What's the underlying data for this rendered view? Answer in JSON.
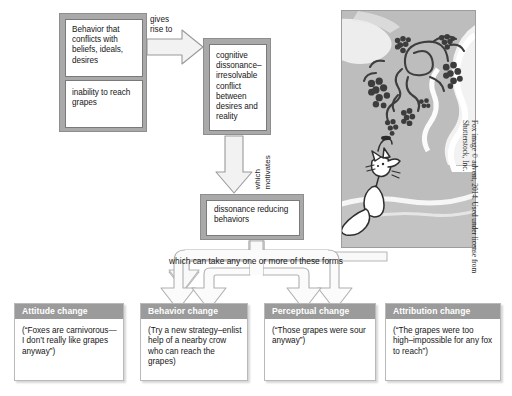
{
  "diagram": {
    "antecedent": {
      "general_label": "Behavior that conflicts with beliefs, ideals, desires",
      "example_label": "inability to reach grapes"
    },
    "connector_1_label_line1": "gives",
    "connector_1_label_line2": "rise to",
    "dissonance": {
      "label": "cognitive dissonance–irresolvable conflict between desires and reality"
    },
    "connector_2_label_line1": "which",
    "connector_2_label_line2": "motivates",
    "reducing": {
      "label": "dissonance reducing behaviors"
    },
    "banner_label": "which can take any one or more of these forms",
    "outcomes": [
      {
        "heading": "Attitude change",
        "example": "(“Foxes are carnivorous—I don’t really like grapes anyway”)"
      },
      {
        "heading": "Behavior change",
        "example": "(Try a new strategy–enlist help of a nearby crow who can reach the grapes)"
      },
      {
        "heading": "Perceptual change",
        "example": "(“Those grapes were sour anyway”)"
      },
      {
        "heading": "Attribution change",
        "example": "(“The grapes were too high–impossible for any fox to reach”)"
      }
    ],
    "photo": {
      "alt": "Illustration of a fox looking up at a bunch of grapes on a vine",
      "credit_line1": "Fox image © advent, 2014. Used under license from",
      "credit_line2": "Shutterstock, Inc."
    },
    "colors": {
      "box_frame": "#a9a9a9",
      "box_fill": "#ffffff",
      "heading_bar": "#9b9b9b",
      "heading_text": "#ffffff",
      "arrow_fill": "#f2f2f2",
      "arrow_stroke": "#9a9a9a",
      "photo_bg": "#bcbcbc",
      "text": "#161616"
    }
  }
}
